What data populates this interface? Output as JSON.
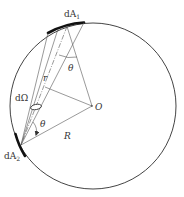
{
  "diagram": {
    "type": "geometric-radiation-view-factor",
    "labels": {
      "dA1": "dA",
      "dA1_sub": "1",
      "dA2": "dA",
      "dA2_sub": "2",
      "dOmega": "dΩ",
      "r": "r",
      "theta_top": "θ",
      "theta_bottom": "θ",
      "center": "O",
      "radius": "R"
    },
    "colors": {
      "line": "#555555",
      "circle": "#444444",
      "surface": "#111111",
      "text": "#333333"
    }
  }
}
